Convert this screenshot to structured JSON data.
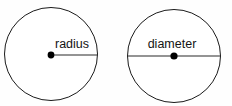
{
  "canvas": {
    "width": 232,
    "height": 106,
    "background_color": "#fefefe",
    "stroke_color": "#1a1a1a",
    "line_color": "#2b2b2b",
    "dot_color": "#000000",
    "text_color": "#141414"
  },
  "figures": [
    {
      "id": "radius-figure",
      "shape": "circle",
      "center_x": 51,
      "center_y": 54,
      "radius": 46.5,
      "label": "radius",
      "label_x": 55,
      "label_y": 48,
      "segment": {
        "type": "radius",
        "x1": 51,
        "y1": 55,
        "x2": 98,
        "y2": 55
      }
    },
    {
      "id": "diameter-figure",
      "shape": "circle",
      "center_x": 174,
      "center_y": 56,
      "radius": 46.5,
      "label": "diameter",
      "label_x": 172,
      "label_y": 48,
      "segment": {
        "type": "diameter",
        "x1": 127.5,
        "y1": 56,
        "x2": 220.5,
        "y2": 56
      }
    }
  ]
}
